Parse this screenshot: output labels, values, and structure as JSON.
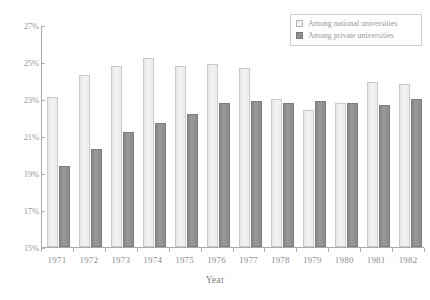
{
  "chart_data": {
    "type": "bar",
    "title": "",
    "xlabel": "Year",
    "ylabel": "",
    "categories": [
      "1971",
      "1972",
      "1973",
      "1974",
      "1975",
      "1976",
      "1977",
      "1978",
      "1979",
      "1980",
      "1981",
      "1982"
    ],
    "series": [
      {
        "name": "Among national universities",
        "color": "#ececec",
        "values": [
          23.1,
          24.3,
          24.8,
          25.2,
          24.8,
          24.9,
          24.7,
          23.0,
          22.4,
          22.8,
          23.9,
          23.8
        ]
      },
      {
        "name": "Among private universities",
        "color": "#8e8e8e",
        "values": [
          19.4,
          20.3,
          21.2,
          21.7,
          22.2,
          22.8,
          22.9,
          22.8,
          22.9,
          22.8,
          22.7,
          23.0
        ]
      }
    ],
    "ylim": [
      15,
      27
    ],
    "ytick_labels": [
      "15%",
      "17%",
      "19%",
      "21%",
      "23%",
      "25%",
      "27%"
    ],
    "ytick_values": [
      15,
      17,
      19,
      21,
      23,
      25,
      27
    ],
    "grid": false,
    "legend_position": "top-right"
  },
  "legend": {
    "entries": [
      {
        "label": "Among national universities",
        "swatch": "light-square-icon"
      },
      {
        "label": "Among private universities",
        "swatch": "dark-square-icon"
      }
    ]
  },
  "axis": {
    "x_title": "Year"
  }
}
